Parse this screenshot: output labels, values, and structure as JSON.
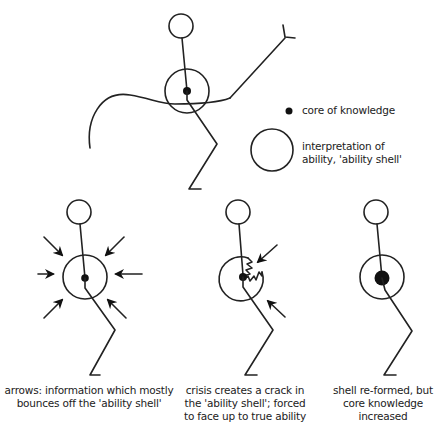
{
  "legend": {
    "core_label": "core of knowledge",
    "shell_label_line1": "interpretation of",
    "shell_label_line2": "ability, 'ability shell'"
  },
  "panels": [
    {
      "id": "arrows",
      "caption_line1": "arrows: information which mostly",
      "caption_line2": "bounces off the 'ability shell'"
    },
    {
      "id": "crisis",
      "caption_line1": "crisis creates a crack in",
      "caption_line2": "the 'ability shell'; forced",
      "caption_line3": "to face up to true ability"
    },
    {
      "id": "reformed",
      "caption_line1": "shell re-formed, but",
      "caption_line2": "core knowledge",
      "caption_line3": "increased"
    }
  ],
  "colors": {
    "ink": "#222222",
    "background": "#ffffff"
  }
}
